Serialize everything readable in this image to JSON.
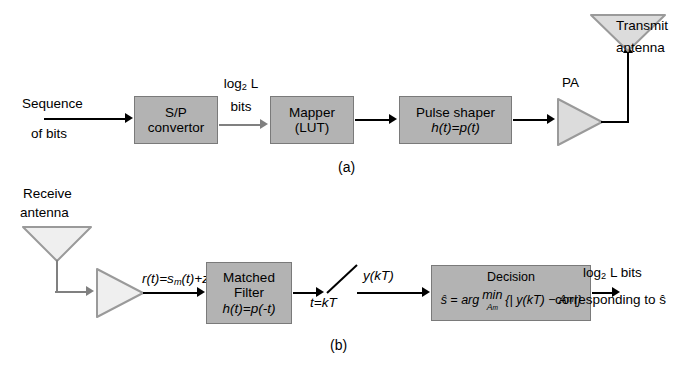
{
  "figure": {
    "caption_a": "(a)",
    "caption_b": "(b)",
    "colors": {
      "block_fill": "#b3b3b3",
      "block_border": "#7a7a7a",
      "triangle_fill": "#dcdcdc",
      "triangle_border": "#9a9a9a",
      "line_black": "#000000",
      "line_gray": "#808080",
      "background": "#ffffff"
    }
  },
  "transmitter": {
    "input_label_line1": "Sequence",
    "input_label_line2": "of bits",
    "blocks": [
      {
        "line1": "S/P",
        "line2": "convertor"
      },
      {
        "line1": "Mapper",
        "line2": "(LUT)"
      },
      {
        "line1": "Pulse shaper",
        "line2": "h(t)=p(t)"
      }
    ],
    "interconnect_label_line1": "log",
    "interconnect_label_sub": "2",
    "interconnect_label_line1b": "L",
    "interconnect_label_line2": "bits",
    "amplifier_label": "PA",
    "antenna_label_line1": "Transmit",
    "antenna_label_line2": "antenna"
  },
  "receiver": {
    "antenna_label_line1": "Receive",
    "antenna_label_line2": "antenna",
    "signal_label": "r(t)=s",
    "signal_label_sub": "m",
    "signal_label_tail": "(t)+z(t)",
    "matched_filter": {
      "line1": "Matched",
      "line2": "Filter",
      "line3": "h(t)=p(-t)"
    },
    "sample_label": "y(kT)",
    "sample_time_label": "t=kT",
    "decision": {
      "title": "Decision",
      "formula_lhs": "ŝ = arg",
      "formula_min": "min",
      "formula_minsub": "A",
      "formula_minsub2": "m",
      "formula_rhs": "{| y(kT) − A",
      "formula_rhs_sub": "m",
      "formula_rhs_tail": " |}"
    },
    "output_line1_a": "log",
    "output_line1_sub": "2",
    "output_line1_b": "L bits",
    "output_line2": "corresponding to ŝ"
  }
}
